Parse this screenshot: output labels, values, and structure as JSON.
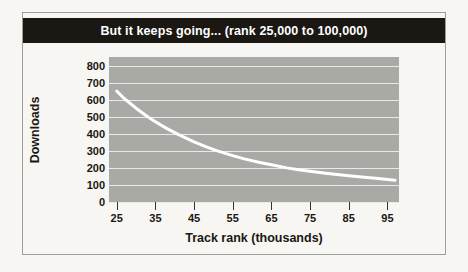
{
  "figure": {
    "title": "But it keeps going... (rank 25,000 to 100,000)",
    "title_bar_color": "#1b1713",
    "title_text_color": "#ffffff",
    "page_background": "#f7f6f2",
    "frame_border_color": "#9d9d99"
  },
  "chart_data": {
    "type": "line",
    "title": "But it keeps going... (rank 25,000 to 100,000)",
    "xlabel": "Track rank (thousands)",
    "ylabel": "Downloads",
    "xlim": [
      23,
      98
    ],
    "ylim": [
      0,
      850
    ],
    "xticks": [
      25,
      35,
      45,
      55,
      65,
      75,
      85,
      95
    ],
    "xtick_labels": [
      "25",
      "35",
      "45",
      "55",
      "65",
      "75",
      "85",
      "95"
    ],
    "yticks": [
      0,
      100,
      200,
      300,
      400,
      500,
      600,
      700,
      800
    ],
    "ytick_labels": [
      "0",
      "100",
      "200",
      "300",
      "400",
      "500",
      "600",
      "700",
      "800"
    ],
    "grid": true,
    "grid_color": "#eceae4",
    "grid_axis": "y",
    "panel_color": "#a9a9a5",
    "legend": false,
    "series": [
      {
        "name": "Downloads",
        "color": "#ffffff",
        "line_width": 3,
        "x": [
          25,
          27,
          30,
          33,
          35,
          38,
          41,
          45,
          48,
          51,
          55,
          58,
          62,
          65,
          69,
          72,
          75,
          79,
          82,
          85,
          89,
          92,
          95,
          97
        ],
        "values": [
          650,
          605,
          550,
          500,
          470,
          430,
          395,
          353,
          325,
          300,
          272,
          253,
          232,
          218,
          200,
          189,
          180,
          169,
          161,
          154,
          145,
          139,
          132,
          128
        ]
      }
    ]
  }
}
